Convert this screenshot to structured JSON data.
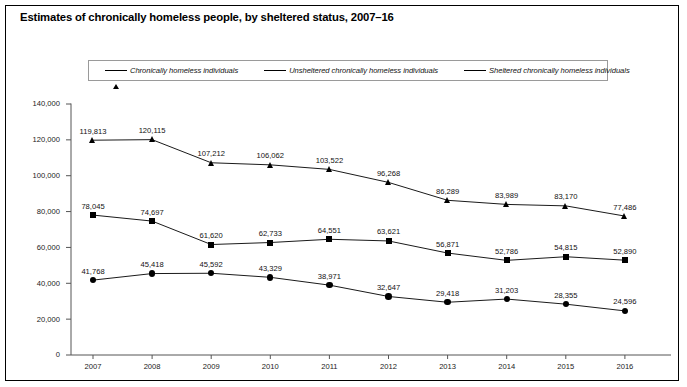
{
  "chart": {
    "title": "Estimates of chronically homeless people, by sheltered status, 2007–16"
  },
  "legend": {
    "position": "top",
    "items": [
      {
        "label": "Chronically homeless individuals",
        "marker": "triangle-marker"
      },
      {
        "label": "Unsheltered chronically homeless individuals",
        "marker": "square-marker"
      },
      {
        "label": "Sheltered chronically homeless individuals",
        "marker": "circle-marker"
      }
    ]
  },
  "chart_data": {
    "type": "line",
    "title": "Estimates of chronically homeless people, by sheltered status, 2007–16",
    "xlabel": "",
    "ylabel": "",
    "grid": false,
    "legend_position": "top",
    "categories": [
      "2007",
      "2008",
      "2009",
      "2010",
      "2011",
      "2012",
      "2013",
      "2014",
      "2015",
      "2016"
    ],
    "x": [
      2007,
      2008,
      2009,
      2010,
      2011,
      2012,
      2013,
      2014,
      2015,
      2016
    ],
    "ylim": [
      0,
      140000
    ],
    "yticks": [
      0,
      20000,
      40000,
      60000,
      80000,
      100000,
      120000,
      140000
    ],
    "ytick_labels": [
      "0",
      "20,000",
      "40,000",
      "60,000",
      "80,000",
      "100,000",
      "120,000",
      "140,000"
    ],
    "series": [
      {
        "name": "Chronically homeless individuals",
        "marker": "triangle",
        "values": [
          119813,
          120115,
          107212,
          106062,
          103522,
          96268,
          86289,
          83989,
          83170,
          77486
        ],
        "labels": [
          "119,813",
          "120,115",
          "107,212",
          "106,062",
          "103,522",
          "96,268",
          "86,289",
          "83,989",
          "83,170",
          "77,486"
        ]
      },
      {
        "name": "Unsheltered chronically homeless individuals",
        "marker": "square",
        "values": [
          78045,
          74697,
          61620,
          62733,
          64551,
          63621,
          56871,
          52786,
          54815,
          52890
        ],
        "labels": [
          "78,045",
          "74,697",
          "61,620",
          "62,733",
          "64,551",
          "63,621",
          "56,871",
          "52,786",
          "54,815",
          "52,890"
        ]
      },
      {
        "name": "Sheltered chronically homeless individuals",
        "marker": "circle",
        "values": [
          41768,
          45418,
          45592,
          43329,
          38971,
          32647,
          29418,
          31203,
          28355,
          24596
        ],
        "labels": [
          "41,768",
          "45,418",
          "45,592",
          "43,329",
          "38,971",
          "32,647",
          "29,418",
          "31,203",
          "28,355",
          "24,596"
        ]
      }
    ]
  },
  "colors": {
    "line": "#000000",
    "axis": "#555555",
    "frame": "#000000",
    "background": "#ffffff"
  }
}
